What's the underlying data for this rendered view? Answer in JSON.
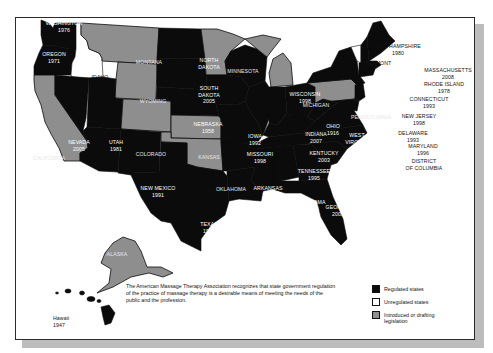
{
  "colors": {
    "regulated": "#0b0b0b",
    "unregulated": "#ffffff",
    "introduced": "#8e8e8e",
    "frame_shadow": "#bdbdbd"
  },
  "states": {
    "washington": {
      "name": "WASHINGTON",
      "year": "1976",
      "status": "regulated"
    },
    "oregon": {
      "name": "OREGON",
      "year": "1971",
      "status": "regulated"
    },
    "idaho": {
      "name": "IDAHO",
      "year": "",
      "status": "unregulated"
    },
    "montana": {
      "name": "MONTANA",
      "year": "",
      "status": "introduced"
    },
    "wyoming": {
      "name": "WYOMING",
      "year": "",
      "status": "introduced"
    },
    "california": {
      "name": "CALIFORNIA",
      "year": "",
      "status": "introduced"
    },
    "nevada": {
      "name": "NEVADA",
      "year": "2005",
      "status": "regulated"
    },
    "utah": {
      "name": "UTAH",
      "year": "1981",
      "status": "regulated"
    },
    "arizona": {
      "name": "ARIZONA",
      "year": "2003",
      "status": "regulated"
    },
    "colorado": {
      "name": "COLORADO",
      "year": "",
      "status": "introduced"
    },
    "new_mexico": {
      "name": "NEW MEXICO",
      "year": "1991",
      "status": "regulated"
    },
    "north_dakota": {
      "name": "NORTH DAKOTA",
      "year": "",
      "status": "regulated"
    },
    "south_dakota": {
      "name": "SOUTH DAKOTA",
      "year": "2005",
      "status": "regulated"
    },
    "nebraska": {
      "name": "NEBRASKA",
      "year": "1958",
      "status": "regulated"
    },
    "kansas": {
      "name": "KANSAS",
      "year": "",
      "status": "introduced"
    },
    "oklahoma": {
      "name": "OKLAHOMA",
      "year": "",
      "status": "introduced"
    },
    "texas": {
      "name": "TEXAS",
      "year": "1985",
      "status": "regulated"
    },
    "minnesota": {
      "name": "MINNESOTA",
      "year": "",
      "status": "introduced"
    },
    "iowa": {
      "name": "IOWA",
      "year": "1992",
      "status": "regulated"
    },
    "missouri": {
      "name": "MISSOURI",
      "year": "1998",
      "status": "regulated"
    },
    "arkansas": {
      "name": "ARKANSAS",
      "year": "1951",
      "status": "regulated"
    },
    "louisiana": {
      "name": "LOUISIANA",
      "year": "1992",
      "status": "regulated"
    },
    "wisconsin": {
      "name": "WISCONSIN",
      "year": "1998",
      "status": "regulated"
    },
    "michigan": {
      "name": "MICHIGAN",
      "year": "",
      "status": "introduced"
    },
    "indiana": {
      "name": "INDIANA",
      "year": "2007",
      "status": "regulated"
    },
    "ohio": {
      "name": "OHIO",
      "year": "1916",
      "status": "regulated"
    },
    "kentucky": {
      "name": "KENTUCKY",
      "year": "2003",
      "status": "regulated"
    },
    "tennessee": {
      "name": "TENNESSEE",
      "year": "1995",
      "status": "regulated"
    },
    "mississippi": {
      "name": "MISSISSIPPI",
      "year": "2001",
      "status": "regulated"
    },
    "alabama": {
      "name": "ALABAMA",
      "year": "1996",
      "status": "regulated"
    },
    "georgia": {
      "name": "GEORGIA",
      "year": "2005",
      "status": "regulated"
    },
    "florida": {
      "name": "FLORIDA",
      "year": "1943",
      "status": "regulated"
    },
    "south_carolina": {
      "name": "SOUTH CAROLINA",
      "year": "1996",
      "status": "regulated"
    },
    "north_carolina": {
      "name": "NORTH CAROLINA",
      "year": "1998",
      "status": "regulated"
    },
    "virginia": {
      "name": "VIRGINIA",
      "year": "1996",
      "status": "regulated"
    },
    "west_virginia": {
      "name": "WEST VIRGINIA",
      "year": "1997",
      "status": "regulated"
    },
    "pennsylvania": {
      "name": "PENNSYLVANIA",
      "year": "",
      "status": "introduced"
    },
    "new_york": {
      "name": "NEW YORK",
      "year": "1967",
      "status": "regulated"
    },
    "vermont": {
      "name": "VERMONT",
      "year": "",
      "status": "unregulated"
    },
    "new_hampshire": {
      "name": "NEW HAMPSHIRE",
      "year": "1980",
      "status": "regulated"
    },
    "maine": {
      "name": "MAINE",
      "year": "1991",
      "status": "regulated"
    },
    "massachusetts": {
      "name": "MASSACHUSETTS",
      "year": "2008",
      "status": "regulated"
    },
    "rhode_island": {
      "name": "RHODE ISLAND",
      "year": "1978",
      "status": "regulated"
    },
    "connecticut": {
      "name": "CONNECTICUT",
      "year": "1993",
      "status": "regulated"
    },
    "new_jersey": {
      "name": "NEW JERSEY",
      "year": "1998",
      "status": "regulated"
    },
    "delaware": {
      "name": "DELAWARE",
      "year": "1993",
      "status": "regulated"
    },
    "maryland": {
      "name": "MARYLAND",
      "year": "1996",
      "status": "regulated"
    },
    "district_of_columbia": {
      "name": "DISTRICT OF COLUMBIA",
      "year": "",
      "status": "regulated"
    },
    "alaska": {
      "name": "ALASKA",
      "year": "",
      "status": "introduced"
    },
    "hawaii": {
      "name": "Hawaii",
      "year": "1947",
      "status": "regulated"
    }
  },
  "labels": {
    "washington": [
      "WASHINGTON",
      "1976"
    ],
    "oregon": [
      "OREGON",
      "1971"
    ],
    "idaho": [
      "IDAHO"
    ],
    "montana": [
      "MONTANA"
    ],
    "wyoming": [
      "WYOMING"
    ],
    "california": [
      "CALIFORNIA"
    ],
    "nevada": [
      "NEVADA",
      "2005"
    ],
    "utah": [
      "UTAH",
      "1981"
    ],
    "arizona": [
      "ARIZONA",
      "2003"
    ],
    "colorado": [
      "COLORADO"
    ],
    "new_mexico": [
      "NEW MEXICO",
      "1991"
    ],
    "north_dakota": [
      "NORTH",
      "DAKOTA"
    ],
    "south_dakota": [
      "SOUTH",
      "DAKOTA",
      "2005"
    ],
    "nebraska": [
      "NEBRASKA",
      "1958"
    ],
    "kansas": [
      "KANSAS"
    ],
    "oklahoma": [
      "OKLAHOMA"
    ],
    "texas": [
      "TEXAS",
      "1985"
    ],
    "minnesota": [
      "MINNESOTA"
    ],
    "iowa": [
      "IOWA",
      "1992"
    ],
    "missouri": [
      "MISSOURI",
      "1998"
    ],
    "arkansas": [
      "ARKANSAS",
      "1951"
    ],
    "louisiana": [
      "LOUISIANA",
      "1992"
    ],
    "wisconsin": [
      "WISCONSIN",
      "1998"
    ],
    "michigan": [
      "MICHIGAN"
    ],
    "indiana": [
      "INDIANA",
      "2007"
    ],
    "ohio": [
      "OHIO",
      "1916"
    ],
    "kentucky": [
      "KENTUCKY",
      "2003"
    ],
    "tennessee": [
      "TENNESSEE",
      "1995"
    ],
    "mississippi": [
      "MISSISSIPPI",
      "2001"
    ],
    "alabama": [
      "ALABAMA",
      "1996"
    ],
    "georgia": [
      "GEORGIA",
      "2005"
    ],
    "florida": [
      "FLORIDA",
      "1943"
    ],
    "south_carolina": [
      "SOUTH",
      "CAROLINA",
      "1996"
    ],
    "north_carolina": [
      "NORTH",
      "CAROLINA",
      "1998"
    ],
    "virginia": [
      "1997 VIRGINIA",
      "1996"
    ],
    "west_virginia": [
      "WEST",
      "VIRGINIA"
    ],
    "pennsylvania": [
      "PENNSYLVANIA"
    ],
    "new_york": [
      "NEW YORK",
      "1967"
    ],
    "vermont": [
      "VERMONT"
    ],
    "new_hampshire": [
      "NEW HAMPSHIRE",
      "1980"
    ],
    "maine": [
      "MAINE",
      "1991"
    ],
    "massachusetts": [
      "MASSACHUSETTS",
      "2008"
    ],
    "rhode_island": [
      "RHODE ISLAND",
      "1978"
    ],
    "connecticut": [
      "CONNECTICUT",
      "1993"
    ],
    "new_jersey": [
      "NEW JERSEY",
      "1998"
    ],
    "delaware": [
      "DELAWARE",
      "1993"
    ],
    "maryland": [
      "MARYLAND",
      "1996"
    ],
    "district_of_columbia": [
      "DISTRICT",
      "OF COLUMBIA"
    ],
    "alaska": [
      "ALASKA"
    ],
    "hawaii": [
      "Hawaii",
      "1947"
    ]
  },
  "statement": "The American Massage Therapy Association recognizes that state government regulation of the practice of massage therapy is a desirable means of meeting the needs of the public and the profession.",
  "legend": {
    "items": [
      {
        "label": "Regulated states",
        "color": "#0b0b0b"
      },
      {
        "label": "Unregulated states",
        "color": "#ffffff"
      },
      {
        "label": "Introduced or drafting legislation",
        "color": "#8e8e8e"
      }
    ]
  }
}
